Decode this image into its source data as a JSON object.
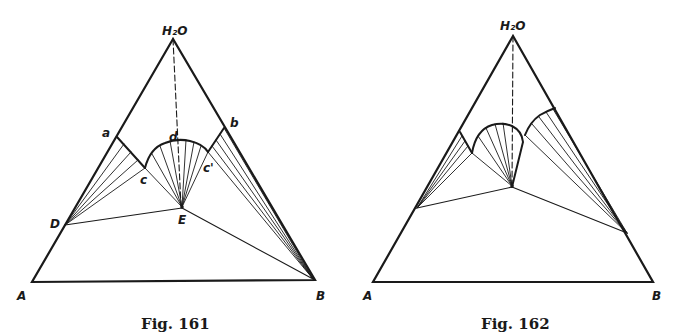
{
  "figures": [
    {
      "caption": "Fig. 161",
      "labels": {
        "apex": "H₂O",
        "A": "A",
        "B": "B",
        "D": "D",
        "E": "E",
        "a": "a",
        "b": "b",
        "c": "c",
        "c_prime": "c'",
        "d": "d"
      }
    },
    {
      "caption": "Fig. 162",
      "labels": {
        "apex": "H₂O",
        "A": "A",
        "B": "B"
      }
    }
  ]
}
